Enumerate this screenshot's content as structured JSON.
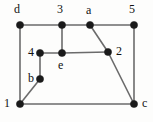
{
  "figure": {
    "name": "undirected-graph-diagram",
    "background_color": "#fdfdfc",
    "width": 153,
    "height": 122
  },
  "style": {
    "edge_color": "#6b6b6b",
    "vertex_color": "#1a1a1a",
    "label_color": "#111111",
    "vertex_radius": 3.6,
    "edge_width": 1.6,
    "label_font_size": 12
  },
  "graph": {
    "vertices": [
      {
        "id": "d",
        "label": "d",
        "x": 20,
        "y": 25,
        "label_x": 14,
        "label_y": 3,
        "label_pos": "above-left"
      },
      {
        "id": "3",
        "label": "3",
        "x": 62,
        "y": 25,
        "label_x": 57,
        "label_y": 3,
        "label_pos": "above"
      },
      {
        "id": "a",
        "label": "a",
        "x": 90,
        "y": 25,
        "label_x": 86,
        "label_y": 4,
        "label_pos": "above"
      },
      {
        "id": "5",
        "label": "5",
        "x": 134,
        "y": 25,
        "label_x": 129,
        "label_y": 3,
        "label_pos": "above"
      },
      {
        "id": "4",
        "label": "4",
        "x": 40,
        "y": 53,
        "label_x": 28,
        "label_y": 46,
        "label_pos": "left"
      },
      {
        "id": "e",
        "label": "e",
        "x": 62,
        "y": 53,
        "label_x": 58,
        "label_y": 59,
        "label_pos": "below"
      },
      {
        "id": "2",
        "label": "2",
        "x": 108,
        "y": 52,
        "label_x": 116,
        "label_y": 45,
        "label_pos": "right"
      },
      {
        "id": "b",
        "label": "b",
        "x": 40,
        "y": 79,
        "label_x": 28,
        "label_y": 72,
        "label_pos": "left"
      },
      {
        "id": "1",
        "label": "1",
        "x": 20,
        "y": 104,
        "label_x": 4,
        "label_y": 97,
        "label_pos": "left"
      },
      {
        "id": "c",
        "label": "c",
        "x": 134,
        "y": 104,
        "label_x": 142,
        "label_y": 97,
        "label_pos": "right"
      }
    ],
    "edges": [
      {
        "from": "d",
        "to": "3"
      },
      {
        "from": "3",
        "to": "a"
      },
      {
        "from": "a",
        "to": "5"
      },
      {
        "from": "d",
        "to": "1"
      },
      {
        "from": "3",
        "to": "e"
      },
      {
        "from": "4",
        "to": "e"
      },
      {
        "from": "e",
        "to": "2"
      },
      {
        "from": "4",
        "to": "b"
      },
      {
        "from": "b",
        "to": "1"
      },
      {
        "from": "a",
        "to": "2"
      },
      {
        "from": "2",
        "to": "c"
      },
      {
        "from": "5",
        "to": "c"
      },
      {
        "from": "1",
        "to": "c"
      }
    ]
  }
}
